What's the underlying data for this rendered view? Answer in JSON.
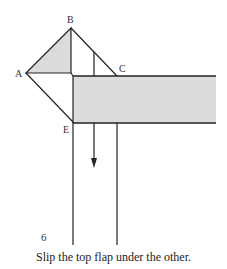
{
  "diagram": {
    "step_number": "6",
    "caption": "Slip the top flap under the other.",
    "labels": {
      "A": "A",
      "B": "B",
      "C": "C",
      "E": "E"
    },
    "colors": {
      "stroke": "#222222",
      "shade": "#dcdcdc"
    }
  }
}
